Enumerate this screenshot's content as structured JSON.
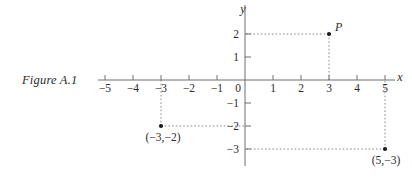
{
  "figure": {
    "caption": "Figure A.1"
  },
  "chart_data": {
    "type": "scatter",
    "title": "Figure A.1",
    "xlabel": "x",
    "ylabel": "y",
    "grid": false,
    "legend": null,
    "xlim": [
      -5.25,
      5.35
    ],
    "ylim": [
      -3.6,
      2.6
    ],
    "origin_label": "0",
    "xticks": [
      -5,
      -4,
      -3,
      -2,
      -1,
      1,
      2,
      3,
      4,
      5
    ],
    "xtick_labels": [
      "−5",
      "−4",
      "−3",
      "−2",
      "−1",
      "1",
      "2",
      "3",
      "4",
      "5"
    ],
    "yticks": [
      2,
      1,
      -1,
      -2,
      -3
    ],
    "ytick_labels": [
      "2",
      "1",
      "−1",
      "−2",
      "−3"
    ],
    "points": [
      {
        "name": "P",
        "label": "P",
        "label_style": "italic",
        "x": 3,
        "y": 2,
        "label_dx": 6,
        "label_dy": -3
      },
      {
        "name": "point-neg3-neg2",
        "label": "(−3,−2)",
        "label_style": "roman",
        "x": -3,
        "y": -2,
        "label_dx": 2,
        "label_dy": 15
      },
      {
        "name": "point-5-neg3",
        "label": "(5,−3)",
        "label_style": "roman",
        "x": 5,
        "y": -3,
        "label_dx": 1,
        "label_dy": 15
      }
    ],
    "guide_lines": [
      {
        "from": [
          3,
          2
        ],
        "to": [
          0,
          2
        ]
      },
      {
        "from": [
          3,
          2
        ],
        "to": [
          3,
          0
        ]
      },
      {
        "from": [
          -3,
          -2
        ],
        "to": [
          0,
          -2
        ]
      },
      {
        "from": [
          -3,
          -2
        ],
        "to": [
          -3,
          0
        ]
      },
      {
        "from": [
          5,
          -3
        ],
        "to": [
          0,
          -3
        ]
      },
      {
        "from": [
          5,
          -3
        ],
        "to": [
          5,
          0
        ]
      }
    ]
  },
  "colors": {
    "axis": "#6e6e6e",
    "guide": "#8a8a8a",
    "text": "#2b2b2b",
    "point": "#1a1a1a",
    "background": "#ffffff"
  }
}
